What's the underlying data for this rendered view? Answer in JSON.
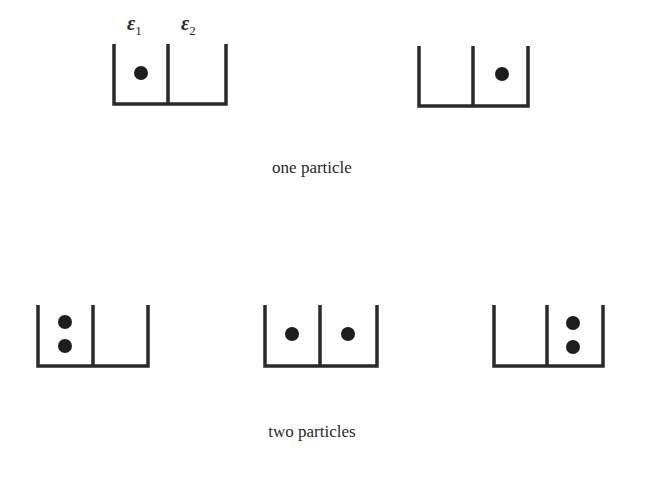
{
  "labels": {
    "level1": "ε",
    "level1_sub": "1",
    "level2": "ε",
    "level2_sub": "2"
  },
  "captions": {
    "one_particle": "one particle",
    "two_particles": "two particles"
  },
  "colors": {
    "stroke": "#2a2a2a",
    "dot": "#1e1e1e",
    "background": "#ffffff"
  },
  "diagrams": {
    "one_particle": [
      {
        "level1_particles": 1,
        "level2_particles": 0
      },
      {
        "level1_particles": 0,
        "level2_particles": 1
      }
    ],
    "two_particles": [
      {
        "level1_particles": 2,
        "level2_particles": 0
      },
      {
        "level1_particles": 1,
        "level2_particles": 1
      },
      {
        "level1_particles": 0,
        "level2_particles": 2
      }
    ]
  }
}
